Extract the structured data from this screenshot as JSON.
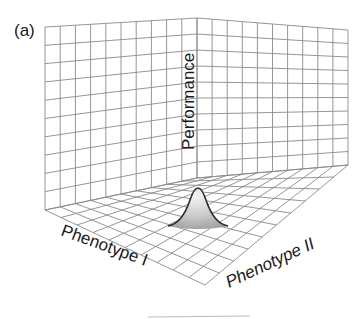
{
  "figure": {
    "panel_label": "(a)",
    "axes": {
      "z_label": "Performance",
      "x_label": "Phenotype I",
      "y_label": "Phenotype II"
    },
    "plot_type": "3d-surface",
    "colors": {
      "grid": "#8a8a8a",
      "text": "#1a1a1a",
      "peak_outline": "#2a2a2a",
      "peak_fill": "#cfcfcf",
      "background": "#ffffff"
    },
    "geometry": {
      "wall_grid_rows": 10,
      "left_wall_cols": 10,
      "right_wall_cols": 10,
      "floor_grid_divisions": 10
    }
  }
}
